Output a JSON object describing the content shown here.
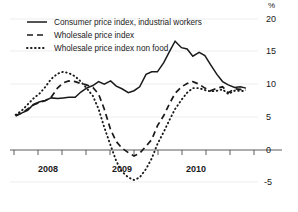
{
  "chart_data": {
    "type": "line",
    "title": "",
    "subtitle": "",
    "xlabel": "",
    "ylabel": "",
    "unit_label": "%",
    "ylim": [
      -5,
      20
    ],
    "yticks": [
      -5,
      0,
      5,
      10,
      15,
      20
    ],
    "ytick_labels": [
      "-5",
      "0",
      "5",
      "10",
      "15",
      "20"
    ],
    "xlim": [
      2007.5,
      2011.0
    ],
    "xticks": [
      2008,
      2009,
      2010
    ],
    "xtick_labels": [
      "2008",
      "2009",
      "2010"
    ],
    "grid": true,
    "legend_position": "top-left",
    "x": [
      2007.58,
      2007.67,
      2007.75,
      2007.83,
      2007.92,
      2008.0,
      2008.08,
      2008.17,
      2008.25,
      2008.33,
      2008.42,
      2008.5,
      2008.58,
      2008.67,
      2008.75,
      2008.83,
      2008.92,
      2009.0,
      2009.08,
      2009.17,
      2009.25,
      2009.33,
      2009.42,
      2009.5,
      2009.58,
      2009.67,
      2009.75,
      2009.83,
      2009.92,
      2010.0,
      2010.08,
      2010.17,
      2010.25,
      2010.33,
      2010.42,
      2010.5,
      2010.58,
      2010.67,
      2010.75,
      2010.83
    ],
    "series": [
      {
        "name": "Consumer price index, industrial workers",
        "style": "solid",
        "values": [
          5.1,
          5.6,
          6.0,
          6.9,
          7.3,
          7.5,
          7.9,
          7.8,
          7.9,
          8.0,
          8.0,
          8.8,
          9.4,
          9.8,
          10.4,
          10.0,
          10.5,
          9.7,
          9.3,
          8.7,
          9.0,
          9.6,
          11.5,
          11.9,
          11.9,
          13.3,
          15.0,
          16.6,
          15.6,
          15.4,
          14.3,
          14.9,
          14.4,
          13.0,
          11.5,
          10.4,
          9.9,
          9.5,
          9.6,
          9.4
        ],
        "min": 5.1,
        "max": 16.6
      },
      {
        "name": "Wholesale price index",
        "style": "dashed",
        "values": [
          5.2,
          5.6,
          6.2,
          6.8,
          7.2,
          7.5,
          8.0,
          9.4,
          10.2,
          10.5,
          10.4,
          10.1,
          9.9,
          9.5,
          8.5,
          6.2,
          3.0,
          1.2,
          0.2,
          -0.5,
          -1.0,
          -0.6,
          0.5,
          1.5,
          3.6,
          5.2,
          7.0,
          8.6,
          9.6,
          10.1,
          10.4,
          10.0,
          9.4,
          9.0,
          9.4,
          9.6,
          8.7,
          9.3,
          9.2,
          9.1
        ],
        "min": -1.0,
        "max": 10.4
      },
      {
        "name": "Wholesale price index non food",
        "style": "dotted",
        "values": [
          5.3,
          6.0,
          6.9,
          7.8,
          8.6,
          9.6,
          10.8,
          11.6,
          11.9,
          11.7,
          11.2,
          10.4,
          9.4,
          8.2,
          6.2,
          3.4,
          0.6,
          -1.8,
          -3.4,
          -4.3,
          -4.7,
          -4.3,
          -3.0,
          -1.4,
          0.8,
          2.7,
          4.5,
          6.2,
          7.6,
          8.7,
          9.4,
          9.4,
          9.1,
          8.9,
          9.0,
          9.2,
          8.5,
          9.0,
          9.0,
          8.9
        ],
        "min": -4.7,
        "max": 11.9
      }
    ]
  },
  "legend": {
    "items": [
      {
        "label": "Consumer price index, industrial workers",
        "style": "solid"
      },
      {
        "label": "Wholesale price index",
        "style": "dashed"
      },
      {
        "label": "Wholesale price index non food",
        "style": "dotted"
      }
    ]
  },
  "axes": {
    "unit": "%",
    "y_labels": [
      "20",
      "15",
      "10",
      "5",
      "0",
      "-5"
    ],
    "x_labels": [
      "2008",
      "2009",
      "2010"
    ]
  }
}
